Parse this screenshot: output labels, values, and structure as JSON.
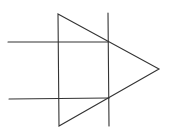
{
  "diagram": {
    "width": 170,
    "height": 140,
    "stroke_color": "#333333",
    "stroke_width": 1.1,
    "triangle": {
      "points": [
        [
          58,
          14
        ],
        [
          159,
          69
        ],
        [
          59,
          126
        ]
      ]
    },
    "vertical_line": {
      "x1": 108,
      "y1": 13,
      "x2": 109,
      "y2": 126
    },
    "horizontal_lines": [
      {
        "x1": 8,
        "y1": 42,
        "x2": 108,
        "y2": 42
      },
      {
        "x1": 9,
        "y1": 99,
        "x2": 109,
        "y2": 98
      }
    ]
  }
}
